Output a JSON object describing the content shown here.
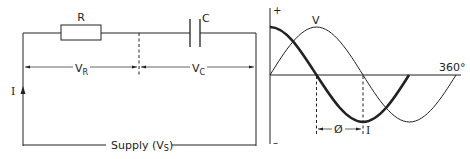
{
  "circuit": {
    "resistor_label": "R",
    "capacitor_label": "C",
    "vr_label": "V",
    "vr_sub": "R",
    "vc_label": "V",
    "vc_sub": "C",
    "current_label": "I",
    "supply_label_prefix": "Supply (V",
    "supply_sub": "S",
    "supply_suffix": ")"
  },
  "graph": {
    "plus_label": "+",
    "minus_label": "–",
    "voltage_label": "V",
    "current_label": "I",
    "angle_label": "360°",
    "phase_label": "Ø"
  },
  "colors": {
    "line": "#222222",
    "background": "#ffffff"
  }
}
